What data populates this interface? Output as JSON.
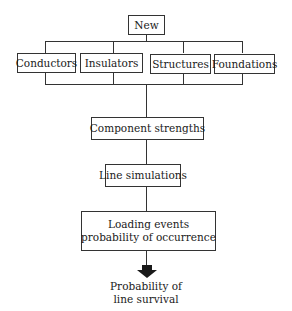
{
  "diagram": {
    "root": {
      "label": "New"
    },
    "components": [
      {
        "label": "Conductors"
      },
      {
        "label": "Insulators"
      },
      {
        "label": "Structures"
      },
      {
        "label": "Foundations"
      }
    ],
    "steps": [
      {
        "label": "Component strengths"
      },
      {
        "label": "Line simulations"
      },
      {
        "label": "Loading events probability of occurrence",
        "line1": "Loading events",
        "line2": "probability of occurrence"
      }
    ],
    "outcome": {
      "line1": "Probability of",
      "line2": "line survival"
    },
    "colors": {
      "stroke": "#333333",
      "arrow": "#1a1a1a",
      "background": "#ffffff"
    }
  }
}
